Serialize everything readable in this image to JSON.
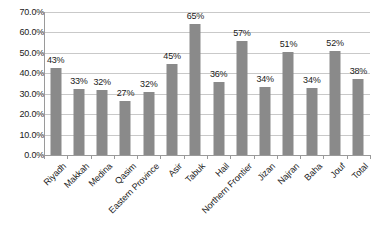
{
  "chart_data": {
    "type": "bar",
    "title": "",
    "subtitle": "",
    "xlabel": "",
    "ylabel": "",
    "ylim": [
      0,
      70
    ],
    "grid": true,
    "legend": false,
    "legend_position": "none",
    "bar_color": "#8a8a8a",
    "gridline_color": "#c9c9c9",
    "axis_color": "#9a9a9a",
    "ytick_labels": [
      "0.0%",
      "10.0%",
      "20.0%",
      "30.0%",
      "40.0%",
      "50.0%",
      "60.0%",
      "70.0%"
    ],
    "ytick_values": [
      0,
      10,
      20,
      30,
      40,
      50,
      60,
      70
    ],
    "categories": [
      "Riyadh",
      "Makkah",
      "Medina",
      "Qasim",
      "Eastern Province",
      "Asir",
      "Tabuk",
      "Hail",
      "Northern Frontier",
      "Jizan",
      "Najran",
      "Baha",
      "Jouf",
      "Total"
    ],
    "values": [
      42.6,
      32.5,
      31.7,
      26.5,
      31.0,
      44.6,
      64.2,
      35.7,
      55.8,
      33.2,
      50.3,
      32.9,
      50.8,
      37.2
    ],
    "data_labels": [
      "43%",
      "33%",
      "32%",
      "27%",
      "32%",
      "45%",
      "65%",
      "36%",
      "57%",
      "34%",
      "51%",
      "34%",
      "52%",
      "38%"
    ]
  }
}
